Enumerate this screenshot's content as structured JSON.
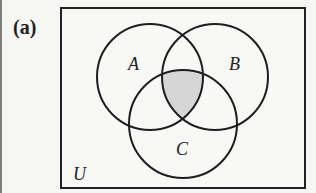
{
  "figure": {
    "panel_label": "(a)",
    "universe_label": "U",
    "sets": [
      {
        "label": "A",
        "cx": 150,
        "cy": 77,
        "r": 53
      },
      {
        "label": "B",
        "cx": 215,
        "cy": 77,
        "r": 53
      },
      {
        "label": "C",
        "cx": 183,
        "cy": 124,
        "r": 54
      }
    ],
    "shaded_region": "A ∩ B ∩ C",
    "shade_color": "#d6d6d6",
    "stroke_color": "#1e1e1e"
  }
}
